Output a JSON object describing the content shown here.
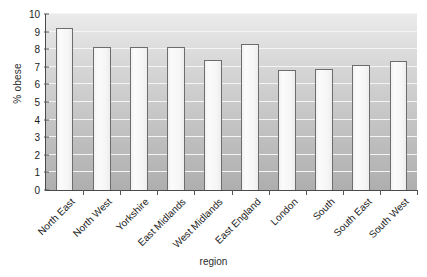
{
  "chart_data": {
    "type": "bar",
    "title": "",
    "xlabel": "region",
    "ylabel": "% obese",
    "categories": [
      "North East",
      "North West",
      "Yorkshire",
      "East Midlands",
      "West Midlands",
      "East England",
      "London",
      "South",
      "South East",
      "South West"
    ],
    "values": [
      9.2,
      8.1,
      8.1,
      8.1,
      7.4,
      8.3,
      6.8,
      6.85,
      7.1,
      7.35
    ],
    "ylim": [
      0,
      10
    ],
    "ytick_labels": [
      "10",
      "9",
      "8",
      "7",
      "6",
      "5",
      "4",
      "3",
      "2",
      "1",
      "0"
    ],
    "ytick_values": [
      10,
      9,
      8,
      7,
      6,
      5,
      4,
      3,
      2,
      1,
      0
    ],
    "grid": true,
    "legend": false,
    "orientation": "vertical",
    "colors": {
      "bar_fill": "#f7f7f7",
      "bar_border": "#6d6d6d",
      "plot_background_top": "#ebebeb",
      "plot_background_bottom": "#aeaeae",
      "gridline": "#f4f4f4",
      "axis": "#4a4a4a",
      "text": "#1c1c1c",
      "page_background": "#ffffff"
    }
  }
}
